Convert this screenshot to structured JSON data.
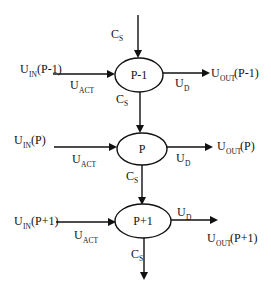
{
  "diagram": {
    "nodes": [
      {
        "id": "p_minus_1",
        "label": "P-1"
      },
      {
        "id": "p",
        "label": "P"
      },
      {
        "id": "p_plus_1",
        "label": "P+1"
      }
    ],
    "labels": {
      "cs_main": "C",
      "cs_sub": "S",
      "u_main": "U",
      "act_sub": "ACT",
      "d_sub": "D",
      "in_sub": "IN",
      "out_sub": "OUT"
    },
    "rows": [
      {
        "input_arg": "(P-1)",
        "output_arg": "(P-1)"
      },
      {
        "input_arg": "(P)",
        "output_arg": "(P)"
      },
      {
        "input_arg": "(P+1)",
        "output_arg": "(P+1)"
      }
    ],
    "colors": {
      "stroke": "#111111",
      "background": "#ffffff"
    }
  }
}
